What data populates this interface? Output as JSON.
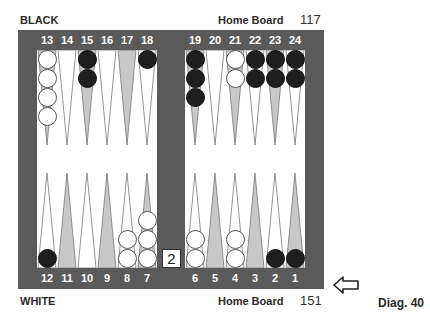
{
  "header": {
    "top_player": "BLACK",
    "top_home_label": "Home Board",
    "top_pip_count": "117",
    "bottom_player": "WHITE",
    "bottom_home_label": "Home Board",
    "bottom_pip_count": "151",
    "diagram_label": "Diag. 40"
  },
  "cube": {
    "value": "2"
  },
  "turn_indicator": {
    "icon": "arrow-left-icon",
    "side": "white"
  },
  "colors": {
    "frame": "#5a5a5a",
    "light_point": "#ffffff",
    "dark_point": "#c8c8c8",
    "white_checker": "#ffffff",
    "black_checker": "#1e1e1e"
  },
  "top_points": [
    {
      "num": "13",
      "shade": "dark",
      "checkers": {
        "color": "white",
        "count": 4
      }
    },
    {
      "num": "14",
      "shade": "light",
      "checkers": {
        "color": null,
        "count": 0
      }
    },
    {
      "num": "15",
      "shade": "dark",
      "checkers": {
        "color": "black",
        "count": 2
      }
    },
    {
      "num": "16",
      "shade": "light",
      "checkers": {
        "color": null,
        "count": 0
      }
    },
    {
      "num": "17",
      "shade": "dark",
      "checkers": {
        "color": null,
        "count": 0
      }
    },
    {
      "num": "18",
      "shade": "light",
      "checkers": {
        "color": "black",
        "count": 1
      }
    },
    {
      "num": "19",
      "shade": "dark",
      "checkers": {
        "color": "black",
        "count": 3
      }
    },
    {
      "num": "20",
      "shade": "light",
      "checkers": {
        "color": null,
        "count": 0
      }
    },
    {
      "num": "21",
      "shade": "dark",
      "checkers": {
        "color": "white",
        "count": 2
      }
    },
    {
      "num": "22",
      "shade": "light",
      "checkers": {
        "color": "black",
        "count": 2
      }
    },
    {
      "num": "23",
      "shade": "dark",
      "checkers": {
        "color": "black",
        "count": 2
      }
    },
    {
      "num": "24",
      "shade": "light",
      "checkers": {
        "color": "black",
        "count": 2
      }
    }
  ],
  "bottom_points": [
    {
      "num": "12",
      "shade": "light",
      "checkers": {
        "color": "black",
        "count": 1
      }
    },
    {
      "num": "11",
      "shade": "dark",
      "checkers": {
        "color": null,
        "count": 0
      }
    },
    {
      "num": "10",
      "shade": "light",
      "checkers": {
        "color": null,
        "count": 0
      }
    },
    {
      "num": "9",
      "shade": "dark",
      "checkers": {
        "color": null,
        "count": 0
      }
    },
    {
      "num": "8",
      "shade": "light",
      "checkers": {
        "color": "white",
        "count": 2
      }
    },
    {
      "num": "7",
      "shade": "dark",
      "checkers": {
        "color": "white",
        "count": 3
      }
    },
    {
      "num": "6",
      "shade": "light",
      "checkers": {
        "color": "white",
        "count": 2
      }
    },
    {
      "num": "5",
      "shade": "dark",
      "checkers": {
        "color": null,
        "count": 0
      }
    },
    {
      "num": "4",
      "shade": "light",
      "checkers": {
        "color": "white",
        "count": 2
      }
    },
    {
      "num": "3",
      "shade": "dark",
      "checkers": {
        "color": null,
        "count": 0
      }
    },
    {
      "num": "2",
      "shade": "light",
      "checkers": {
        "color": "black",
        "count": 1
      }
    },
    {
      "num": "1",
      "shade": "dark",
      "checkers": {
        "color": "black",
        "count": 1
      }
    }
  ]
}
